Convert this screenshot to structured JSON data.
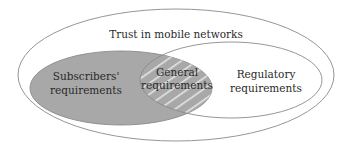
{
  "diagram": {
    "type": "venn",
    "outer": {
      "label": "Trust in mobile networks"
    },
    "sets": [
      {
        "id": "subscribers",
        "label_line1": "Subscribers'",
        "label_line2": "requirements",
        "fill": "#a8a8a8"
      },
      {
        "id": "regulatory",
        "label_line1": "Regulatory",
        "label_line2": "requirements",
        "fill": "#ffffff"
      }
    ],
    "intersection": {
      "label_line1": "General",
      "label_line2": "requirements",
      "pattern": "diagonal-stripes"
    },
    "colors": {
      "stroke": "#8a8a8a",
      "stripe": "#e4e4e4",
      "gray": "#a8a8a8"
    }
  }
}
